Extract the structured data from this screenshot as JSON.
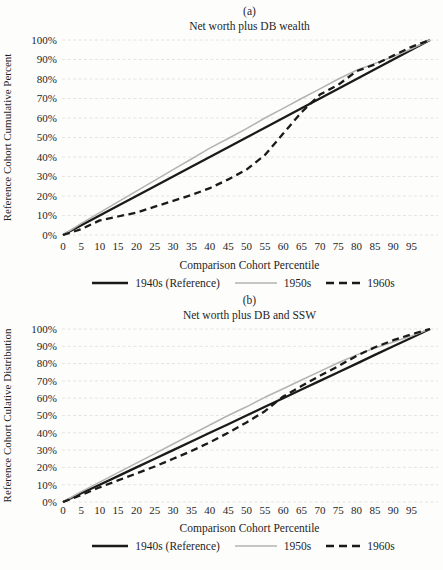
{
  "figure": {
    "background": "#fdfdfb",
    "text_color": "#1f1f1f",
    "grid_color": "#e4e4e0",
    "line_black": "#1a1a1a",
    "line_gray": "#b3b3b3"
  },
  "chart_data": [
    {
      "type": "line",
      "panel_label": "(a)",
      "title": "Net worth plus DB wealth",
      "xlabel": "Comparison Cohort Percentile",
      "ylabel": "Reference Cohort Cumulative Percent",
      "xlim": [
        0,
        100
      ],
      "ylim": [
        0,
        100
      ],
      "grid": "horizontal-only",
      "legend_position": "bottom",
      "x_ticks": [
        0,
        5,
        10,
        15,
        20,
        25,
        30,
        35,
        40,
        45,
        50,
        55,
        60,
        65,
        70,
        75,
        80,
        85,
        90,
        95
      ],
      "y_ticks": [
        0,
        10,
        20,
        30,
        40,
        50,
        60,
        70,
        80,
        90,
        100
      ],
      "y_tick_labels": [
        "0%",
        "10%",
        "20%",
        "30%",
        "40%",
        "50%",
        "60%",
        "70%",
        "80%",
        "90%",
        "100%"
      ],
      "x": [
        0,
        5,
        10,
        15,
        20,
        25,
        30,
        35,
        40,
        45,
        50,
        55,
        60,
        65,
        70,
        75,
        80,
        85,
        90,
        95,
        100
      ],
      "series": [
        {
          "name": "1940s (Reference)",
          "color": "#1a1a1a",
          "width": 2.3,
          "dash": null,
          "values": [
            0,
            5,
            10,
            15,
            20,
            25,
            30,
            35,
            40,
            45,
            50,
            55,
            60,
            65,
            70,
            75,
            80,
            85,
            90,
            95,
            100
          ]
        },
        {
          "name": "1950s",
          "color": "#b3b3b3",
          "width": 1.5,
          "dash": null,
          "values": [
            0,
            6,
            11.5,
            17,
            22.5,
            28,
            33.5,
            39,
            44.5,
            49.5,
            54.5,
            60,
            65,
            70,
            75,
            80,
            84.5,
            88,
            91.5,
            95.5,
            100
          ]
        },
        {
          "name": "1960s",
          "color": "#1a1a1a",
          "width": 2.3,
          "dash": "7 4.5",
          "values": [
            0,
            3,
            7.5,
            9.5,
            11.5,
            14.5,
            17.5,
            20.5,
            24,
            28.5,
            33.5,
            41,
            52,
            63,
            72,
            77,
            84,
            87.5,
            92,
            96.5,
            100
          ]
        }
      ]
    },
    {
      "type": "line",
      "panel_label": "(b)",
      "title": "Net worth plus DB and SSW",
      "xlabel": "Comparison Cohort Percentile",
      "ylabel": "Reference Cohort Culative Distribution",
      "xlim": [
        0,
        100
      ],
      "ylim": [
        0,
        100
      ],
      "grid": "horizontal-only",
      "legend_position": "bottom",
      "x_ticks": [
        0,
        5,
        10,
        15,
        20,
        25,
        30,
        35,
        40,
        45,
        50,
        55,
        60,
        65,
        70,
        75,
        80,
        85,
        90,
        95
      ],
      "y_ticks": [
        0,
        10,
        20,
        30,
        40,
        50,
        60,
        70,
        80,
        90,
        100
      ],
      "y_tick_labels": [
        "0%",
        "10%",
        "20%",
        "30%",
        "40%",
        "50%",
        "60%",
        "70%",
        "80%",
        "90%",
        "100%"
      ],
      "x": [
        0,
        5,
        10,
        15,
        20,
        25,
        30,
        35,
        40,
        45,
        50,
        55,
        60,
        65,
        70,
        75,
        80,
        85,
        90,
        95,
        100
      ],
      "series": [
        {
          "name": "1940s (Reference)",
          "color": "#1a1a1a",
          "width": 2.3,
          "dash": null,
          "values": [
            0,
            5,
            10,
            15,
            20,
            25,
            30,
            35,
            40,
            45,
            50,
            55,
            60,
            65,
            70,
            75,
            80,
            85,
            90,
            95,
            100
          ]
        },
        {
          "name": "1950s",
          "color": "#b3b3b3",
          "width": 1.5,
          "dash": null,
          "values": [
            0,
            6,
            11.5,
            17,
            22.5,
            28,
            33.5,
            39,
            44.5,
            50,
            55,
            60.5,
            65.5,
            70.5,
            75.5,
            80.5,
            85,
            89,
            92.5,
            96,
            100
          ]
        },
        {
          "name": "1960s",
          "color": "#1a1a1a",
          "width": 2.3,
          "dash": "7 4.5",
          "values": [
            0,
            4,
            8.5,
            12.5,
            16.5,
            20.5,
            25,
            29.5,
            34.5,
            40,
            46,
            52.5,
            61,
            67,
            73,
            78.5,
            84.5,
            89.5,
            93.5,
            97,
            100
          ]
        }
      ]
    }
  ]
}
